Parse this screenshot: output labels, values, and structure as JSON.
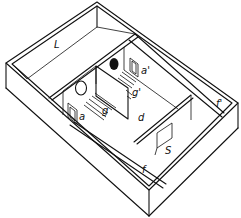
{
  "figure": {
    "type": "isometric floor plan of an apparatus (line drawing)",
    "background": "#ffffff",
    "ink": "#111111"
  },
  "labels": {
    "L": "L",
    "a": "a",
    "a_prime": "a'",
    "g": "g",
    "g_prime": "g'",
    "d": "d",
    "S": "S",
    "f": "f",
    "f_prime": "f'"
  },
  "regions": [
    {
      "id": "L",
      "description": "long compartment along the top-left"
    },
    {
      "id": "a",
      "description": "door opening, left inner room"
    },
    {
      "id": "a_prime",
      "description": "door opening, right inner room"
    },
    {
      "id": "g",
      "description": "grid floor, left room (with open circle target)"
    },
    {
      "id": "g_prime",
      "description": "grid floor, right room (with filled circle target)"
    },
    {
      "id": "d",
      "description": "central area"
    },
    {
      "id": "S",
      "description": "start box with door"
    },
    {
      "id": "f",
      "description": "front corridor"
    },
    {
      "id": "f_prime",
      "description": "right corridor"
    }
  ],
  "markers": {
    "open_circle": "open circle on left room back wall",
    "filled_circle": "black filled circle on right room back wall"
  }
}
